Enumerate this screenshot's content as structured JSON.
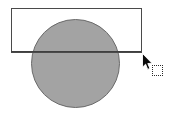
{
  "canvas": {
    "width": 170,
    "height": 118,
    "background_color": "#ffffff",
    "description": "Drawing canvas with a filled circle overlapping an unfilled rectangle"
  },
  "shapes": [
    {
      "name": "rectangle",
      "kind": "rectangle",
      "fill": "none",
      "stroke_color": "#4a4a4a",
      "stroke_width": 1,
      "x": 11,
      "y": 8,
      "width": 130,
      "height": 44
    },
    {
      "name": "circle",
      "kind": "circle",
      "fill_color": "#a3a3a3",
      "stroke_color": "#6a6a6a",
      "stroke_width": 1,
      "center_x": 75,
      "center_y": 63,
      "radius": 44,
      "diameter": 88
    }
  ],
  "pointer": {
    "name": "mouse-cursor",
    "type": "arrow",
    "x": 142,
    "y": 53,
    "fill_color": "#000000",
    "outline_color": "#ffffff"
  },
  "drag_indicator": {
    "name": "drag-ghost-square",
    "type": "dotted-square",
    "x": 152,
    "y": 65,
    "size": 11,
    "border_style": "dotted",
    "border_color": "#2b2b2b"
  }
}
